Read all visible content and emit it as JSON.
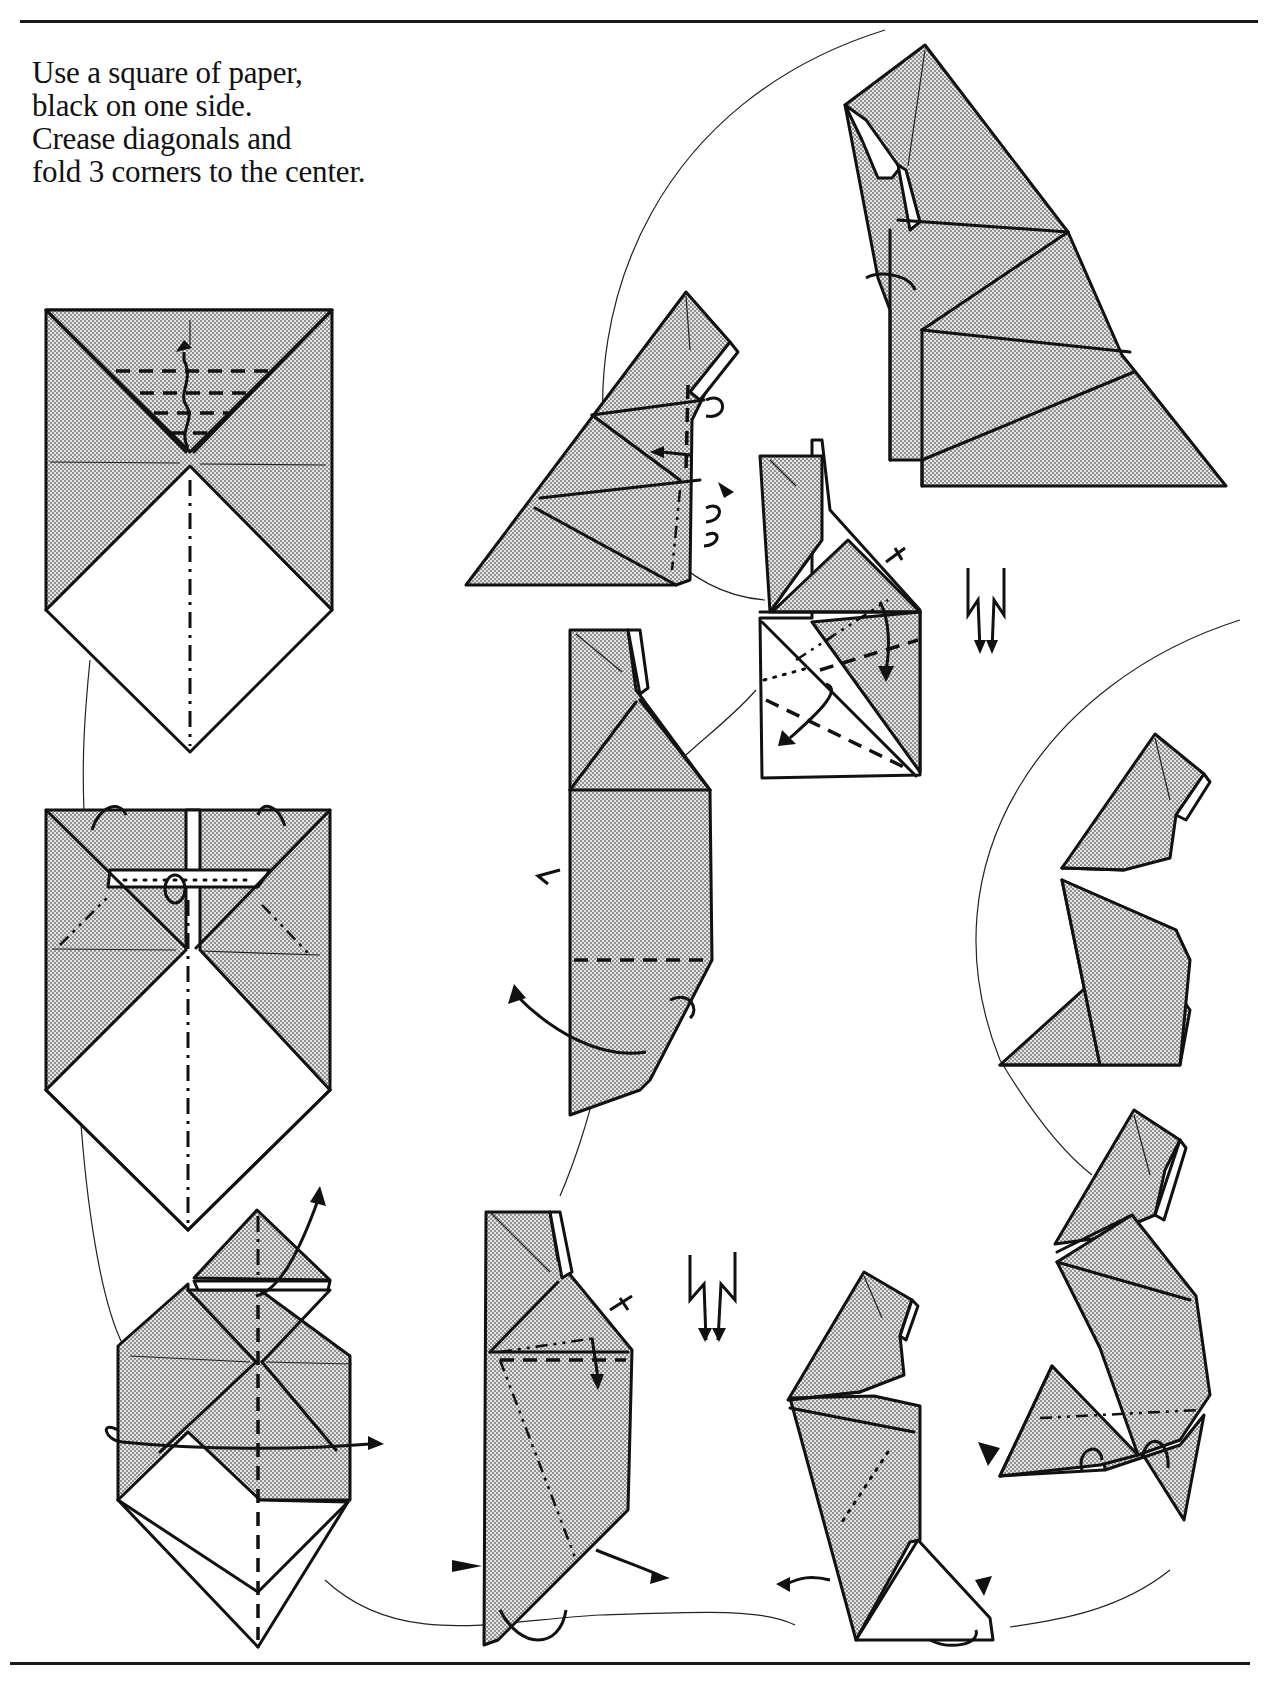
{
  "page": {
    "type": "origami instruction diagram page",
    "intro_text": {
      "line1": "Use a square of paper,",
      "line2": "black on one side.",
      "line3": "Crease diagonals and",
      "line4": "fold 3 corners to the center."
    },
    "colors": {
      "ink": "#111111",
      "paper": "#ffffff",
      "shaded_side": "#c8c8c8"
    }
  },
  "steps": [
    {
      "id": 1,
      "name": "step-1-pleat-top-corner",
      "symbols": [
        "valley-fold-lines",
        "pleat-arrow",
        "mountain-crease"
      ]
    },
    {
      "id": 2,
      "name": "step-2-reverse-folds-top",
      "symbols": [
        "mountain-fold-lines",
        "fold-behind-arrows",
        "pleat"
      ]
    },
    {
      "id": 3,
      "name": "step-3-fold-in-half",
      "symbols": [
        "valley-fold-centerline",
        "fold-over-arrow",
        "fold-up-arrow"
      ]
    },
    {
      "id": 4,
      "name": "step-4-crimp",
      "symbols": [
        "crimp-symbol",
        "mountain-fold-lines",
        "push-arrow",
        "fold-arrow"
      ]
    },
    {
      "id": 5,
      "name": "step-5-fold-corner",
      "symbols": [
        "valley-fold-line",
        "fold-behind-arrow",
        "push-arrow"
      ]
    },
    {
      "id": 6,
      "name": "step-6-crimp-and-fold",
      "symbols": [
        "crimp-symbol",
        "valley-fold-lines",
        "dotted-line",
        "arrows"
      ]
    },
    {
      "id": 7,
      "name": "step-7-shape-figure",
      "symbols": [
        "mountain-fold-line",
        "pleat-arrows",
        "push-arrow"
      ]
    },
    {
      "id": 8,
      "name": "step-8-finished-figure",
      "symbols": []
    },
    {
      "id": 9,
      "name": "step-9-reverse-fold-base",
      "symbols": [
        "dotted-line",
        "push-arrow",
        "fold-arrow"
      ]
    },
    {
      "id": 10,
      "name": "step-10-fold-base",
      "symbols": [
        "mountain-fold-line",
        "push-arrow",
        "pleat-arrows"
      ]
    },
    {
      "id": 11,
      "name": "step-11-seated-figure",
      "symbols": []
    }
  ]
}
